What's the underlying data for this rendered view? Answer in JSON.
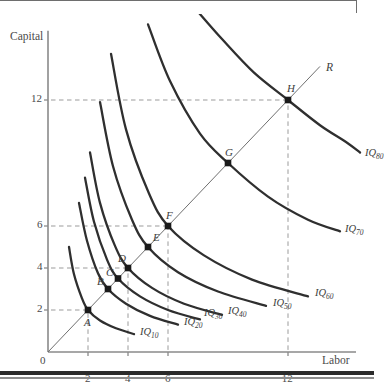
{
  "figure": {
    "axis_x_title": "Labor",
    "axis_y_title": "Capital",
    "origin_label": "0",
    "ray_label": "R"
  },
  "chart_data": {
    "type": "line",
    "title": "",
    "subtitle": "",
    "xlabel": "Labor",
    "ylabel": "Capital",
    "xlim": [
      0,
      15
    ],
    "ylim": [
      0,
      15
    ],
    "grid": false,
    "legend_position": "inline-right-of-curve",
    "x_ticks": [
      "0",
      "2",
      "4",
      "6",
      "12"
    ],
    "x_tick_values": [
      0,
      2,
      4,
      6,
      12
    ],
    "y_ticks": [
      "2",
      "4",
      "6",
      "12"
    ],
    "y_tick_values": [
      2,
      4,
      6,
      12
    ],
    "annotations": [
      "Dashed guide lines connect axis ticks 2, 4, 6 and 12 to points A, D, F and H",
      "Ray R is the expansion path through the origin at 45 degrees"
    ],
    "ray": {
      "name": "R",
      "label": "R",
      "from": [
        0,
        0
      ],
      "to": [
        13.6,
        13.6
      ],
      "slope": 1
    },
    "points": [
      {
        "label": "A",
        "x": 2,
        "y": 2,
        "isoquant": "IQ10"
      },
      {
        "label": "B",
        "x": 3,
        "y": 3,
        "isoquant": "IQ20"
      },
      {
        "label": "C",
        "x": 3.5,
        "y": 3.5,
        "isoquant": "IQ30"
      },
      {
        "label": "D",
        "x": 4,
        "y": 4,
        "isoquant": "IQ40"
      },
      {
        "label": "E",
        "x": 5,
        "y": 5,
        "isoquant": "IQ50"
      },
      {
        "label": "F",
        "x": 6,
        "y": 6,
        "isoquant": "IQ60"
      },
      {
        "label": "G",
        "x": 9,
        "y": 9,
        "isoquant": "IQ70"
      },
      {
        "label": "H",
        "x": 12,
        "y": 12,
        "isoquant": "IQ80"
      }
    ],
    "series": [
      {
        "name": "IQ10",
        "label": "IQ",
        "sub": "10",
        "output": 10,
        "point": "A",
        "x": [
          1.05,
          1.3,
          1.7,
          2.0,
          2.6,
          3.4,
          4.3
        ],
        "y": [
          5.0,
          3.7,
          2.55,
          2.0,
          1.5,
          1.13,
          0.85
        ]
      },
      {
        "name": "IQ20",
        "label": "IQ",
        "sub": "20",
        "output": 20,
        "point": "B",
        "x": [
          1.55,
          1.95,
          2.5,
          3.0,
          3.9,
          5.1,
          6.5
        ],
        "y": [
          7.1,
          5.3,
          3.75,
          3.0,
          2.3,
          1.72,
          1.3
        ]
      },
      {
        "name": "IQ30",
        "label": "IQ",
        "sub": "30",
        "output": 30,
        "point": "C",
        "x": [
          1.85,
          2.3,
          2.95,
          3.5,
          4.6,
          6.0,
          7.6
        ],
        "y": [
          8.3,
          6.2,
          4.4,
          3.5,
          2.65,
          2.0,
          1.55
        ]
      },
      {
        "name": "IQ40",
        "label": "IQ",
        "sub": "40",
        "output": 40,
        "point": "D",
        "x": [
          2.1,
          2.6,
          3.35,
          4.0,
          5.2,
          6.8,
          8.7
        ],
        "y": [
          9.5,
          7.1,
          5.05,
          4.0,
          3.05,
          2.3,
          1.77
        ]
      },
      {
        "name": "IQ50",
        "label": "IQ",
        "sub": "50",
        "output": 50,
        "point": "E",
        "x": [
          2.6,
          3.25,
          4.2,
          5.0,
          6.5,
          8.5,
          10.9
        ],
        "y": [
          11.9,
          8.85,
          6.3,
          5.0,
          3.8,
          2.88,
          2.2
        ]
      },
      {
        "name": "IQ60",
        "label": "IQ",
        "sub": "60",
        "output": 60,
        "point": "F",
        "x": [
          3.15,
          3.9,
          5.05,
          6.0,
          7.8,
          10.2,
          13.0
        ],
        "y": [
          14.2,
          10.6,
          7.55,
          6.0,
          4.6,
          3.45,
          2.65
        ]
      },
      {
        "name": "IQ70",
        "label": "IQ",
        "sub": "70",
        "output": 70,
        "point": "G",
        "x": [
          5.0,
          6.1,
          7.6,
          9.0,
          11.0,
          13.0,
          14.6
        ],
        "y": [
          15.6,
          12.9,
          10.4,
          9.0,
          7.4,
          6.3,
          5.75
        ]
      },
      {
        "name": "IQ80",
        "label": "IQ",
        "sub": "80",
        "output": 80,
        "point": "H",
        "x": [
          7.5,
          8.7,
          10.3,
          12.0,
          13.6,
          14.9,
          15.6
        ],
        "y": [
          16.2,
          14.9,
          13.3,
          12.0,
          10.8,
          10.0,
          9.5
        ]
      }
    ]
  }
}
